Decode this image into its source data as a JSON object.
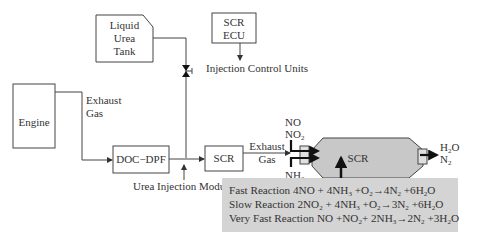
{
  "diagram": {
    "engine": {
      "label": "Engine"
    },
    "exhaust_gas_1": {
      "line1": "Exhaust",
      "line2": "Gas"
    },
    "doc_dpf": {
      "label": "DOC−DPF"
    },
    "liquid_urea_tank": {
      "line1": "Liquid",
      "line2": "Urea",
      "line3": "Tank"
    },
    "scr_ecu": {
      "line1": "SCR",
      "line2": "ECU"
    },
    "injection_control_units": {
      "label": "Injection Control Units"
    },
    "urea_injection_module": {
      "label": "Urea Injection Module"
    },
    "scr_small": {
      "label": "SCR"
    },
    "exhaust_gas_2": {
      "line1": "Exhaust",
      "line2": "Gas"
    },
    "inputs": {
      "no": "NO",
      "no2_base": "NO",
      "no2_sub": "2",
      "nh3_base": "NH",
      "nh3_sub": "3",
      "urea": "Urea"
    },
    "scr_catalyst": {
      "label": "SCR"
    },
    "outputs": {
      "h2o_a": "H",
      "h2o_sub": "2",
      "h2o_b": "O",
      "n2_base": "N",
      "n2_sub": "2"
    },
    "reactions": [
      {
        "name": "Fast Reaction",
        "equation": "4NO + 4NH3 +O2→4N2 +6H2O"
      },
      {
        "name": "Slow Reaction",
        "equation": "2NO2 + 4NH3 +O2→3N2 +6H2O"
      },
      {
        "name": "Very Fast Reaction",
        "equation": "NO +NO2+ 2NH3→2N2 +3H2O"
      }
    ]
  }
}
